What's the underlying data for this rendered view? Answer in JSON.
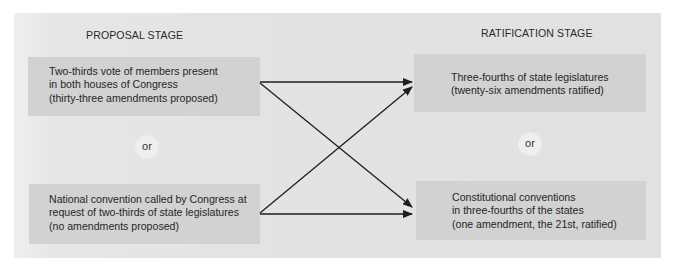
{
  "diagram": {
    "type": "flow",
    "stages": {
      "proposal": {
        "title": "PROPOSAL STAGE",
        "methods": [
          {
            "id": "congress-vote",
            "lines": [
              "Two-thirds vote of members present",
              "in both houses of Congress",
              "(thirty-three amendments proposed)"
            ]
          },
          {
            "id": "national-convention",
            "lines": [
              "National convention called by Congress at",
              "request of two-thirds of state legislatures",
              "(no amendments proposed)"
            ]
          }
        ],
        "separator": "or"
      },
      "ratification": {
        "title": "RATIFICATION STAGE",
        "methods": [
          {
            "id": "state-legislatures",
            "lines": [
              "Three-fourths of state legislatures",
              "(twenty-six amendments ratified)"
            ]
          },
          {
            "id": "state-conventions",
            "lines": [
              "Constitutional conventions",
              "in three-fourths of the states",
              "(one amendment, the 21st, ratified)"
            ]
          }
        ],
        "separator": "or"
      }
    },
    "edges": [
      {
        "from": "congress-vote",
        "to": "state-legislatures"
      },
      {
        "from": "congress-vote",
        "to": "state-conventions"
      },
      {
        "from": "national-convention",
        "to": "state-legislatures"
      },
      {
        "from": "national-convention",
        "to": "state-conventions"
      }
    ],
    "colors": {
      "panel": "#e3e3e3",
      "box": "#d2d2d2",
      "text": "#2b2b2b",
      "arrow": "#1e1e1e",
      "or_circle": "#efefef"
    }
  }
}
